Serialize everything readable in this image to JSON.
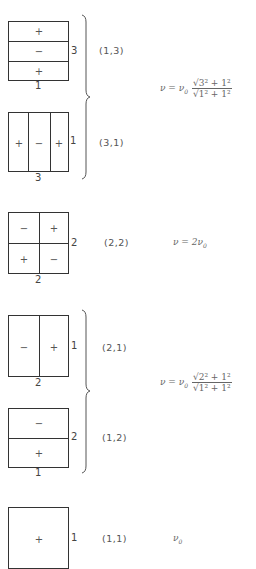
{
  "modes": [
    {
      "id": "1_3",
      "label": "(1,3)",
      "side_label": "3",
      "bottom_label": "1",
      "cells": [
        "+",
        "−",
        "+"
      ],
      "layout": "rows"
    },
    {
      "id": "3_1",
      "label": "(3,1)",
      "side_label": "1",
      "bottom_label": "3",
      "cells": [
        "+",
        "−",
        "+"
      ],
      "layout": "cols"
    },
    {
      "id": "2_2",
      "label": "(2,2)",
      "side_label": "2",
      "bottom_label": "2",
      "cells": [
        "−",
        "+",
        "+",
        "−"
      ],
      "layout": "grid"
    },
    {
      "id": "2_1",
      "label": "(2,1)",
      "side_label": "1",
      "bottom_label": "2",
      "cells": [
        "−",
        "+"
      ],
      "layout": "cols"
    },
    {
      "id": "1_2",
      "label": "(1,2)",
      "side_label": "2",
      "bottom_label": "1",
      "cells": [
        "−",
        "+"
      ],
      "layout": "rows"
    },
    {
      "id": "1_1",
      "label": "(1,1)",
      "side_label": "1",
      "bottom_label": "",
      "cells": [
        "+"
      ],
      "layout": "single"
    }
  ],
  "formulas": {
    "group_13_31": {
      "lhs": "ν = ν",
      "sub": "0",
      "num": "√3² + 1²",
      "den": "√1² + 1²"
    },
    "mode_22": {
      "text": "ν = 2ν",
      "sub": "0"
    },
    "group_21_12": {
      "lhs": "ν = ν",
      "sub": "0",
      "num": "√2² + 1²",
      "den": "√1² + 1²"
    },
    "mode_11": {
      "text": "ν",
      "sub": "0"
    }
  }
}
